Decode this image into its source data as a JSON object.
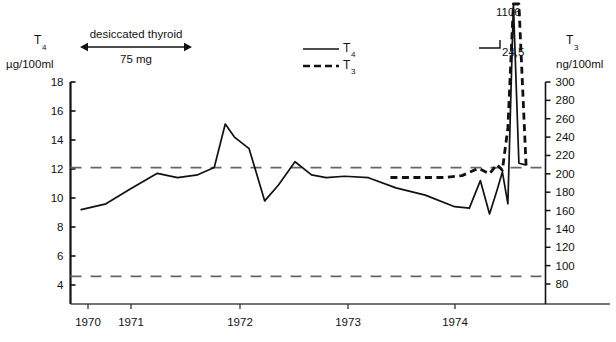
{
  "figure": {
    "background": "#ffffff",
    "ink": "#111111",
    "reference_line_color": "#666666"
  },
  "axes": {
    "left": {
      "title": "T",
      "title_sub": "4",
      "unit": "µg/100ml",
      "ticks": [
        18,
        16,
        14,
        12,
        10,
        8,
        6,
        4
      ],
      "range": [
        3.0,
        18.0
      ]
    },
    "right": {
      "title": "T",
      "title_sub": "3",
      "unit": "ng/100ml",
      "ticks": [
        300,
        280,
        260,
        240,
        220,
        200,
        180,
        160,
        140,
        120,
        100,
        80
      ],
      "range": [
        60,
        300
      ]
    },
    "x": {
      "ticks": [
        "1970",
        "1971",
        "1972",
        "1973",
        "1974"
      ]
    }
  },
  "treatment_bar": {
    "label": "desiccated thyroid",
    "dose": "75 mg"
  },
  "legend": {
    "items": [
      {
        "style": "solid",
        "label": "T",
        "sub": "4"
      },
      {
        "style": "dashed",
        "label": "T",
        "sub": "3"
      }
    ]
  },
  "annotations": [
    {
      "name": "t3-peak-value",
      "text": "1106"
    },
    {
      "name": "t4-peak-value",
      "text": "24,5"
    }
  ],
  "chart_data": {
    "type": "line",
    "title": "",
    "xlabel": "",
    "ylabel": "T4 µg/100ml",
    "ylabel_right": "T3 ng/100ml",
    "ylim": [
      3.0,
      18.0
    ],
    "ylim_right": [
      60,
      300
    ],
    "xlim": [
      1969.85,
      1974.95
    ],
    "grid": false,
    "legend_position": "top-center",
    "reference_lines": [
      {
        "name": "upper-normal-limit",
        "y": 12.1,
        "style": "dashed"
      },
      {
        "name": "lower-normal-limit",
        "y": 4.6,
        "style": "dashed"
      }
    ],
    "series": [
      {
        "name": "T4",
        "label": "T4",
        "style": "solid",
        "unit": "µg/100ml",
        "axis": "left",
        "x": [
          1969.95,
          1970.22,
          1970.48,
          1970.78,
          1971.0,
          1971.22,
          1971.4,
          1971.52,
          1971.62,
          1971.78,
          1971.95,
          1972.1,
          1972.28,
          1972.46,
          1972.62,
          1972.82,
          1973.08,
          1973.38,
          1973.7,
          1974.02,
          1974.18,
          1974.3,
          1974.4,
          1974.48,
          1974.54,
          1974.6,
          1974.66,
          1974.72,
          1974.78
        ],
        "y": [
          9.2,
          9.6,
          10.6,
          11.7,
          11.4,
          11.6,
          12.1,
          15.1,
          14.2,
          13.4,
          9.8,
          10.9,
          12.5,
          11.6,
          11.4,
          11.5,
          11.4,
          10.7,
          10.2,
          9.4,
          9.3,
          11.2,
          8.9,
          10.5,
          11.8,
          9.6,
          24.5,
          12.4,
          12.3
        ],
        "peak_label": "24,5"
      },
      {
        "name": "T3",
        "label": "T3",
        "style": "dashed",
        "unit": "ng/100ml",
        "axis": "right",
        "x": [
          1973.32,
          1973.62,
          1973.92,
          1974.1,
          1974.28,
          1974.4,
          1974.48,
          1974.54,
          1974.6,
          1974.66,
          1974.72,
          1974.8
        ],
        "y": [
          196,
          196,
          196,
          198,
          206,
          200,
          210,
          204,
          250,
          420,
          1106,
          205
        ],
        "peak_label": "1106"
      }
    ]
  }
}
